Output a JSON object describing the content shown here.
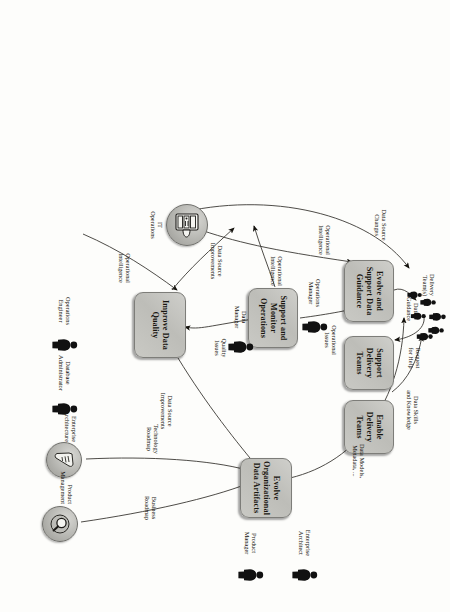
{
  "diagram": {
    "orientation_note": "scanned page rotated 90 degrees",
    "box_fill": "#c6c6c1",
    "box_border": "#7d7d79",
    "ink": "#14120d",
    "paper": "#fdfdfb"
  },
  "nodes": [
    {
      "id": "improve-data-quality",
      "label": "Improve Data\nQuality"
    },
    {
      "id": "support-monitor-operations",
      "label": "Support and\nMonitor\nOperations"
    },
    {
      "id": "evolve-support-data-guidance",
      "label": "Evolve and\nSupport Data\nGuidance"
    },
    {
      "id": "support-delivery-teams",
      "label": "Support\nDelivery Teams"
    },
    {
      "id": "enable-delivery-teams",
      "label": "Enable\nDelivery Teams"
    },
    {
      "id": "evolve-organizational-data-artifacts",
      "label": "Evolve\nOrganizational\nData Artifacts"
    }
  ],
  "actors": [
    {
      "id": "operations-engineer",
      "label": "Operations\nEngineer",
      "icon": "person-icon"
    },
    {
      "id": "database-administrator",
      "label": "Database\nAdministrator",
      "icon": "person-icon"
    },
    {
      "id": "data-manager",
      "label": "Data\nManager",
      "icon": "person-icon"
    },
    {
      "id": "operations-manager",
      "label": "Operations\nManager",
      "icon": "person-icon"
    },
    {
      "id": "product-manager",
      "label": "Product\nManager",
      "icon": "person-icon"
    },
    {
      "id": "enterprise-architect",
      "label": "Enterprise\nArchitect",
      "icon": "person-icon"
    },
    {
      "id": "delivery-teams",
      "label": "Delivery\nTeam(s)",
      "icon": "people-group-icon"
    }
  ],
  "systems": [
    {
      "id": "it-operations",
      "label": "IT\nOperations",
      "icon": "server-rack-icon"
    },
    {
      "id": "enterprise-architecture",
      "label": "Enterprise\nArchitecture",
      "icon": "blueprint-icon"
    },
    {
      "id": "product-management",
      "label": "Product\nManagement",
      "icon": "magnifier-disc-icon"
    }
  ],
  "flows": [
    {
      "id": "operational-intelligence-to-quality",
      "label": "Operational\nIntelligence"
    },
    {
      "id": "data-source-improvements",
      "label": "Data Source\nImprovements"
    },
    {
      "id": "quality-issues",
      "label": "Quality\nIssues"
    },
    {
      "id": "operational-intelligence-to-it",
      "label": "Operational\nIntelligence"
    },
    {
      "id": "operational-issues",
      "label": "Operational\nIssues"
    },
    {
      "id": "operational-intelligence-to-guidance",
      "label": "Operational\nIntelligence"
    },
    {
      "id": "data-source-changes",
      "label": "Data Source\nChanges"
    },
    {
      "id": "data-source-improvements-to-artifacts",
      "label": "Data Source\nImprovements"
    },
    {
      "id": "technology-roadmap",
      "label": "Technology\nRoadmap"
    },
    {
      "id": "business-roadmap",
      "label": "Business\nRoadmap"
    },
    {
      "id": "data-models-metadata",
      "label": "Data Models,\nMetadata, ..."
    },
    {
      "id": "data-guidance",
      "label": "Data\nGuidance"
    },
    {
      "id": "request-for-help",
      "label": "Request\nfor Help"
    },
    {
      "id": "data-skills-and-knowledge",
      "label": "Data Skills\nand Knowledge"
    }
  ]
}
